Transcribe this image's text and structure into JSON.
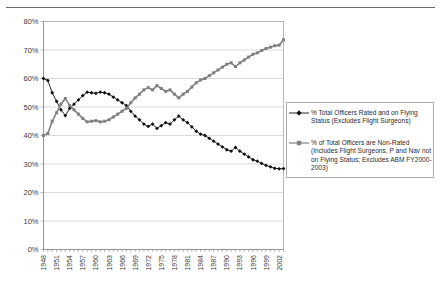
{
  "chart_data": {
    "type": "line",
    "title": "",
    "xlabel": "",
    "ylabel": "",
    "ylim": [
      0,
      80
    ],
    "ytick_labels": [
      "0%",
      "10%",
      "20%",
      "30%",
      "40%",
      "50%",
      "60%",
      "70%",
      "80%"
    ],
    "ytick_values": [
      0,
      10,
      20,
      30,
      40,
      50,
      60,
      70,
      80
    ],
    "grid": true,
    "legend_position": "right",
    "x": [
      1948,
      1949,
      1950,
      1951,
      1952,
      1953,
      1954,
      1955,
      1956,
      1957,
      1958,
      1959,
      1960,
      1961,
      1962,
      1963,
      1964,
      1965,
      1966,
      1967,
      1968,
      1969,
      1970,
      1971,
      1972,
      1973,
      1974,
      1975,
      1976,
      1977,
      1978,
      1979,
      1980,
      1981,
      1982,
      1983,
      1984,
      1985,
      1986,
      1987,
      1988,
      1989,
      1990,
      1991,
      1992,
      1993,
      1994,
      1995,
      1996,
      1997,
      1998,
      1999,
      2000,
      2001,
      2002,
      2003
    ],
    "xtick_labels": [
      "1948",
      "1951",
      "1954",
      "1957",
      "1960",
      "1963",
      "1966",
      "1969",
      "1972",
      "1975",
      "1978",
      "1981",
      "1984",
      "1987",
      "1990",
      "1993",
      "1996",
      "1999",
      "2002"
    ],
    "series": [
      {
        "name": "% Total Officers Rated and on Flying Status (Excludes Flight Surgeons)",
        "marker": "diamond",
        "color": "#101010",
        "values": [
          60.0,
          59.3,
          55.0,
          52.0,
          49.0,
          47.0,
          49.5,
          51.0,
          52.5,
          54.0,
          55.2,
          55.0,
          54.8,
          55.2,
          55.0,
          54.5,
          53.5,
          52.5,
          51.5,
          50.5,
          48.5,
          46.8,
          45.5,
          44.0,
          43.2,
          44.0,
          42.5,
          43.5,
          44.5,
          44.0,
          45.5,
          46.8,
          45.5,
          44.5,
          43.0,
          41.5,
          40.5,
          40.0,
          39.0,
          38.0,
          37.0,
          36.0,
          35.0,
          34.5,
          35.8,
          34.5,
          33.5,
          32.5,
          31.5,
          31.0,
          30.2,
          29.5,
          29.0,
          28.5,
          28.3,
          28.4
        ]
      },
      {
        "name": "% of Total Officers are Non-Rated (Includes Flight Surgeons, P and Nav not on Flying Status; Excludes ABM FY2000-2003)",
        "marker": "square",
        "color": "#808080",
        "values": [
          40.0,
          40.7,
          45.0,
          48.0,
          51.0,
          53.0,
          50.5,
          49.0,
          47.5,
          46.0,
          44.8,
          45.0,
          45.2,
          44.8,
          45.0,
          45.5,
          46.5,
          47.5,
          48.5,
          49.5,
          51.5,
          53.2,
          54.5,
          56.0,
          56.8,
          56.0,
          57.5,
          56.5,
          55.5,
          56.0,
          54.5,
          53.2,
          54.5,
          55.5,
          57.0,
          58.5,
          59.5,
          60.0,
          61.0,
          62.0,
          63.0,
          64.0,
          65.0,
          65.5,
          64.2,
          65.5,
          66.5,
          67.5,
          68.5,
          69.0,
          69.8,
          70.5,
          71.0,
          71.5,
          71.7,
          73.6
        ]
      }
    ]
  },
  "legend": {
    "entries": [
      {
        "label": "% Total Officers Rated and on Flying Status (Excludes Flight Surgeons)",
        "marker": "diamond",
        "color": "#101010"
      },
      {
        "label": "% of Total Officers are Non-Rated (Includes Flight Surgeons, P and Nav not on Flying Status; Excludes ABM FY2000-2003)",
        "marker": "square",
        "color": "#808080"
      }
    ]
  }
}
